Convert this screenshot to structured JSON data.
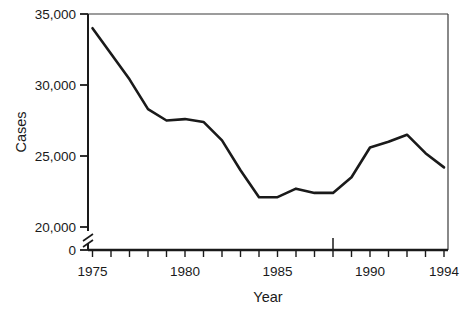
{
  "chart_data": {
    "type": "line",
    "title": "",
    "xlabel": "Year",
    "ylabel": "Cases",
    "x": [
      1975,
      1976,
      1977,
      1978,
      1979,
      1980,
      1981,
      1982,
      1983,
      1984,
      1985,
      1986,
      1987,
      1988,
      1989,
      1990,
      1991,
      1992,
      1993,
      1994
    ],
    "values": [
      34000,
      32200,
      30400,
      28300,
      27500,
      27600,
      27400,
      26100,
      24000,
      22100,
      22100,
      22700,
      22400,
      22400,
      23500,
      25600,
      26000,
      26500,
      25200,
      24200
    ],
    "series": [
      {
        "name": "Cases",
        "values": [
          34000,
          32200,
          30400,
          28300,
          27500,
          27600,
          27400,
          26100,
          24000,
          22100,
          22100,
          22700,
          22400,
          22400,
          23500,
          25600,
          26000,
          26500,
          25200,
          24200
        ]
      }
    ],
    "xlim": [
      1975,
      1994
    ],
    "ylim": [
      20000,
      35000
    ],
    "y_axis_break": true,
    "y_break_label": "0",
    "grid": false,
    "legend": null,
    "line_color": "#1a1a1a",
    "axis_color": "#1a1a1a",
    "background_color": "#ffffff",
    "y_tick_labels": [
      "35,000",
      "30,000",
      "25,000",
      "20,000",
      "0"
    ],
    "y_tick_values": [
      35000,
      30000,
      25000,
      20000,
      0
    ],
    "x_tick_labels": [
      "1975",
      "1980",
      "1985",
      "1990",
      "1994"
    ],
    "x_tick_values": [
      1975,
      1980,
      1985,
      1990,
      1994
    ],
    "x_minor_tick_interval": 1,
    "annotations": [
      {
        "name": "year-1988-marker",
        "x": 1988,
        "type": "upward-tick"
      }
    ]
  }
}
